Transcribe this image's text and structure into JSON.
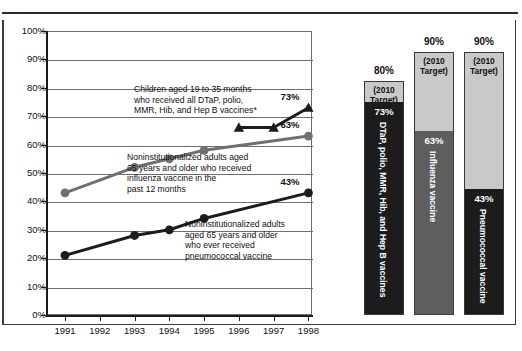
{
  "chart_data": {
    "type": "line",
    "title": "",
    "xlabel": "",
    "ylabel": "",
    "x": [
      1991,
      1992,
      1993,
      1994,
      1995,
      1996,
      1997,
      1998
    ],
    "xticklabels": [
      "1991",
      "1992",
      "1993",
      "1994",
      "1995",
      "1996",
      "1997",
      "1998"
    ],
    "ylim": [
      0,
      100
    ],
    "yticklabels": [
      "0%",
      "10%",
      "20%",
      "30%",
      "40%",
      "50%",
      "60%",
      "70%",
      "80%",
      "90%",
      "100%"
    ],
    "ytickvalues": [
      0,
      10,
      20,
      30,
      40,
      50,
      60,
      70,
      80,
      90,
      100
    ],
    "grid": true,
    "legend": "none",
    "series": [
      {
        "name": "Children aged 19 to 35 months who received all DTaP, polio, MMR, Hib, and Hep B vaccines*",
        "marker": "triangle",
        "color": "#1c1c1c",
        "x": [
          1996,
          1997,
          1998
        ],
        "values": [
          66,
          66,
          73
        ],
        "end_label": "73%"
      },
      {
        "name": "Noninstitutionalized adults aged 65 years and older who received influenza vaccine in the past 12 months",
        "marker": "circle",
        "color": "#6f6f6f",
        "x": [
          1991,
          1993,
          1994,
          1995,
          1998
        ],
        "values": [
          43,
          52,
          55,
          58,
          63
        ],
        "end_label": "63%"
      },
      {
        "name": "Noninstitutionalized adults aged 65 years and older who ever received pneumococcal vaccine",
        "marker": "circle",
        "color": "#1c1c1c",
        "x": [
          1991,
          1993,
          1994,
          1995,
          1998
        ],
        "values": [
          21,
          28,
          30,
          34,
          43
        ],
        "end_label": "43%"
      }
    ],
    "bars": [
      {
        "label": "DTaP, polio, MMR, Hib, and Hep B vaccines",
        "value": 73,
        "value_label": "73%",
        "target": 80,
        "target_label": "80%",
        "target_tag": "(2010\nTarget)",
        "target_tag_line1": "(2010",
        "target_tag_line2": "Target)",
        "fill_color": "#1c1c1c",
        "value_text_color": "#ffffff"
      },
      {
        "label": "Influenza vaccine",
        "value": 63,
        "value_label": "63%",
        "target": 90,
        "target_label": "90%",
        "target_tag_line1": "(2010",
        "target_tag_line2": "Target)",
        "fill_color": "#5e5e5e",
        "value_text_color": "#ffffff"
      },
      {
        "label": "Pneumococcal vaccine",
        "value": 43,
        "value_label": "43%",
        "target": 90,
        "target_label": "90%",
        "target_tag_line1": "(2010",
        "target_tag_line2": "Target)",
        "fill_color": "#1c1c1c",
        "value_text_color": "#ffffff"
      }
    ],
    "annotations": [
      {
        "id": "dtap",
        "lines": [
          "Children aged 19 to 35 months",
          "who received all DTaP, polio,",
          "MMR, Hib, and Hep B vaccines*"
        ]
      },
      {
        "id": "influenza",
        "lines": [
          "Noninstitutionalized adults aged",
          "65 years and older who received",
          "influenza vaccine in the",
          "past 12 months"
        ]
      },
      {
        "id": "pneumococcal",
        "lines": [
          "Noninstitutionalized adults",
          "aged 65 years and older",
          "who ever received",
          "pneumococcal vaccine"
        ]
      }
    ],
    "colors": {
      "dark": "#1c1c1c",
      "gray": "#6f6f6f",
      "bar_target_bg": "#c9c9c9",
      "grid": "#6e6e6e",
      "frame": "#3a3a3a"
    }
  }
}
